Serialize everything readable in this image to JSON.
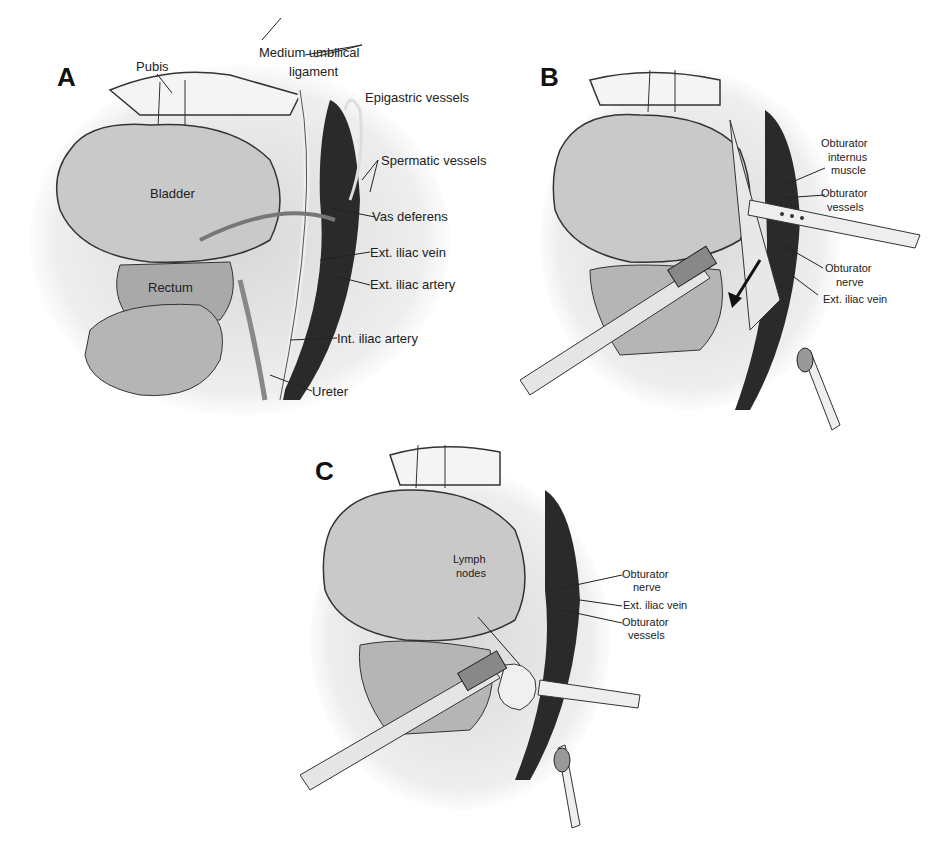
{
  "panels": [
    {
      "letter": "A",
      "labels": {
        "pubis": "Pubis",
        "medium_umbilical_1": "Medium umbilical",
        "medium_umbilical_2": "ligament",
        "epigastric": "Epigastric vessels",
        "spermatic": "Spermatic vessels",
        "bladder": "Bladder",
        "vas_deferens": "Vas deferens",
        "ext_iliac_vein": "Ext. iliac vein",
        "ext_iliac_artery": "Ext. iliac artery",
        "rectum": "Rectum",
        "int_iliac_artery": "Int. iliac artery",
        "ureter": "Ureter"
      }
    },
    {
      "letter": "B",
      "labels": {
        "obt_internus_1": "Obturator",
        "obt_internus_2": "internus",
        "obt_internus_3": "muscle",
        "obt_vessels_1": "Obturator",
        "obt_vessels_2": "vessels",
        "obt_nerve_1": "Obturator",
        "obt_nerve_2": "nerve",
        "ext_iliac_vein": "Ext. iliac vein"
      }
    },
    {
      "letter": "C",
      "labels": {
        "lymph_1": "Lymph",
        "lymph_2": "nodes",
        "obt_nerve_1": "Obturator",
        "obt_nerve_2": "nerve",
        "ext_iliac_vein": "Ext. iliac vein",
        "obt_vessels_1": "Obturator",
        "obt_vessels_2": "vessels"
      }
    }
  ]
}
